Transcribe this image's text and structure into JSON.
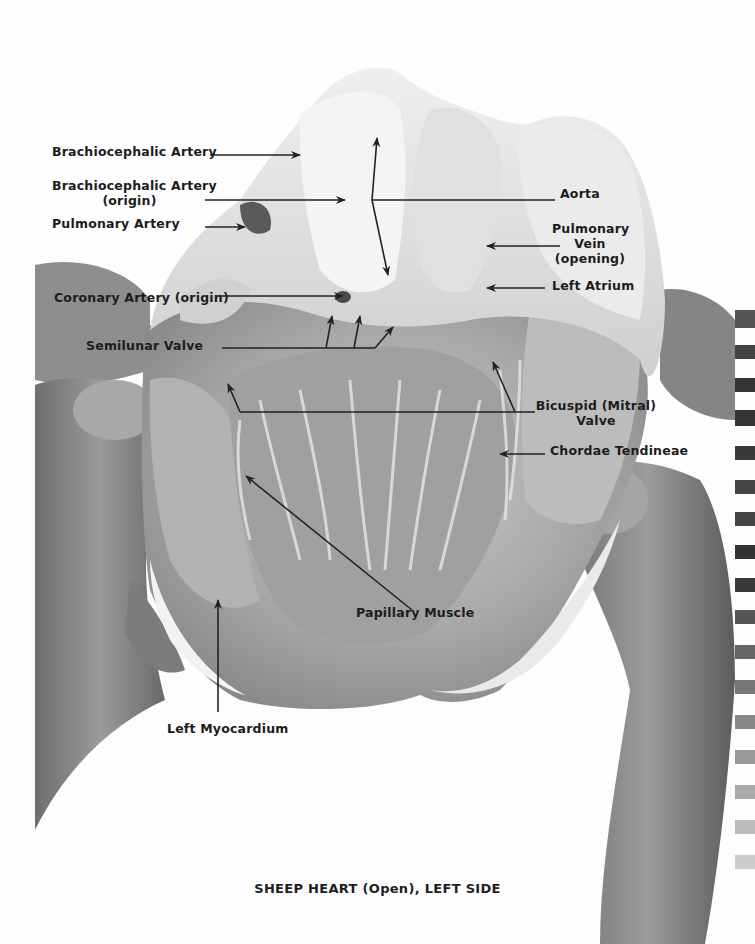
{
  "figure": {
    "caption": "SHEEP HEART (Open), LEFT SIDE",
    "colors": {
      "background": "#fdfdfd",
      "label_text": "#1c1c1c",
      "leader_line": "#222222",
      "tissue_light": "#e6e6e6",
      "tissue_mid": "#b8b8b8",
      "tissue_dark": "#7a7a7a"
    }
  },
  "labels": {
    "brachiocephalic_artery": "Brachiocephalic Artery",
    "brachiocephalic_artery_origin_line1": "Brachiocephalic Artery",
    "brachiocephalic_artery_origin_line2": "(origin)",
    "pulmonary_artery": "Pulmonary Artery",
    "coronary_artery_origin": "Coronary Artery (origin)",
    "semilunar_valve": "Semilunar Valve",
    "aorta": "Aorta",
    "pulmonary_vein_line1": "Pulmonary",
    "pulmonary_vein_line2": "Vein",
    "pulmonary_vein_line3": "(opening)",
    "left_atrium": "Left Atrium",
    "bicuspid_valve_line1": "Bicuspid (Mitral)",
    "bicuspid_valve_line2": "Valve",
    "chordae_tendineae": "Chordae Tendineae",
    "papillary_muscle": "Papillary Muscle",
    "left_myocardium": "Left Myocardium"
  }
}
